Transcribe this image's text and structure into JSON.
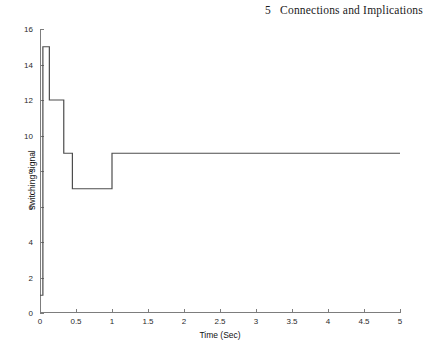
{
  "page_header": {
    "chapter_number": "5",
    "chapter_title": "Connections and Implications"
  },
  "chart_data": {
    "type": "line",
    "style": "step",
    "title": "",
    "xlabel": "Time (Sec)",
    "ylabel": "switching signal",
    "xlim": [
      0,
      5
    ],
    "ylim": [
      0,
      16
    ],
    "xticks": [
      0,
      0.5,
      1,
      1.5,
      2,
      2.5,
      3,
      3.5,
      4,
      4.5,
      5
    ],
    "xticklabels": [
      "0",
      "0.5",
      "1",
      "1.5",
      "2",
      "2.5",
      "3",
      "3.5",
      "4",
      "4.5",
      "5"
    ],
    "yticks": [
      0,
      2,
      4,
      6,
      8,
      10,
      12,
      14,
      16
    ],
    "yticklabels": [
      "0",
      "2",
      "4",
      "6",
      "8",
      "10",
      "12",
      "14",
      "16"
    ],
    "grid": false,
    "legend": null,
    "line_color": "#4d4d4d",
    "line_width": 1.2,
    "series": [
      {
        "name": "switching signal",
        "x": [
          0.0,
          0.04,
          0.04,
          0.13,
          0.13,
          0.33,
          0.33,
          0.45,
          0.45,
          1.0,
          1.0,
          5.0
        ],
        "y": [
          1,
          1,
          15,
          15,
          12,
          12,
          9,
          9,
          7,
          7,
          9,
          9
        ]
      }
    ],
    "segments": [
      {
        "t_start": 0.0,
        "t_end": 0.04,
        "value": 1
      },
      {
        "t_start": 0.04,
        "t_end": 0.13,
        "value": 15
      },
      {
        "t_start": 0.13,
        "t_end": 0.33,
        "value": 12
      },
      {
        "t_start": 0.33,
        "t_end": 0.45,
        "value": 9
      },
      {
        "t_start": 0.45,
        "t_end": 1.0,
        "value": 7
      },
      {
        "t_start": 1.0,
        "t_end": 5.0,
        "value": 9
      }
    ]
  }
}
